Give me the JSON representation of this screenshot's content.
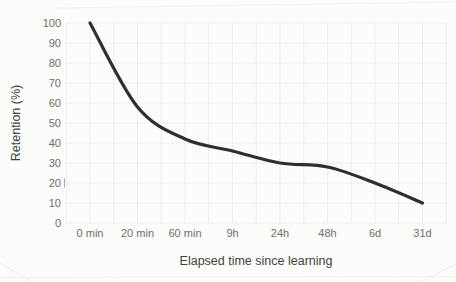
{
  "page": {
    "background": "#fcfcfb"
  },
  "chart_data": {
    "type": "line",
    "title": "",
    "xlabel": "Elapsed time since learning",
    "ylabel": "Retention (%)",
    "categories": [
      "0 min",
      "20 min",
      "60 min",
      "9h",
      "24h",
      "48h",
      "6d",
      "31d"
    ],
    "series": [
      {
        "name": "Retention",
        "values": [
          100,
          58,
          42,
          36,
          30,
          28,
          20,
          10
        ]
      }
    ],
    "ylim": [
      0,
      100
    ],
    "yticks": [
      0,
      10,
      20,
      30,
      40,
      50,
      60,
      70,
      80,
      90,
      100
    ],
    "grid": true,
    "x_minor_gridlines": true,
    "legend": "none",
    "line_color": "#2f2f2f",
    "grid_color": "#ededed",
    "tick_label_color": "#6e6e6e",
    "axis_title_color": "#414141",
    "stray_mark_after_ytick": 20
  }
}
